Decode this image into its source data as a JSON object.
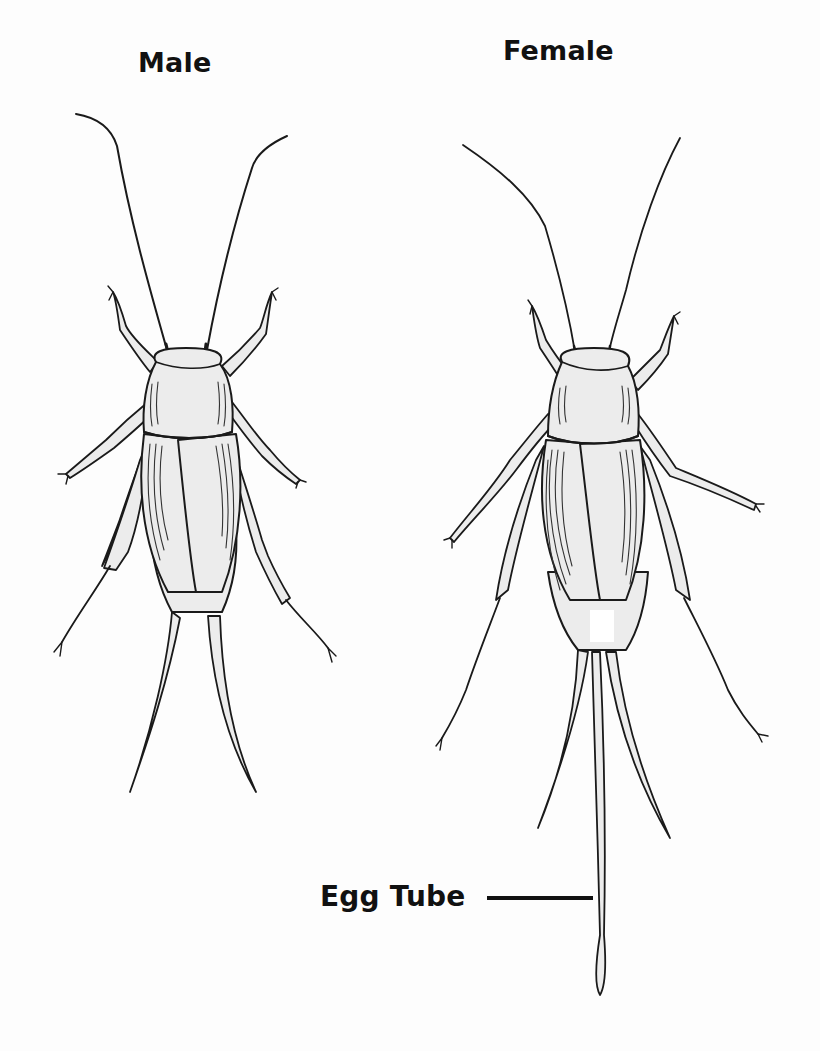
{
  "figure": {
    "background_color": "#fdfdfd",
    "ink_color": "#1a1a1a",
    "labels": {
      "male": "Male",
      "female": "Female",
      "egg_tube": "Egg Tube"
    },
    "specimens": [
      {
        "id": "male",
        "title": "Male",
        "features": [
          "antenna-pair",
          "head",
          "pronotum",
          "wings",
          "front-legs",
          "middle-legs",
          "hind-legs",
          "cerci-pair"
        ]
      },
      {
        "id": "female",
        "title": "Female",
        "features": [
          "antenna-pair",
          "head",
          "pronotum",
          "wings",
          "front-legs",
          "middle-legs",
          "hind-legs",
          "cerci-pair",
          "ovipositor"
        ]
      }
    ],
    "callout": {
      "label": "Egg Tube",
      "points_to": "female-ovipositor"
    }
  }
}
